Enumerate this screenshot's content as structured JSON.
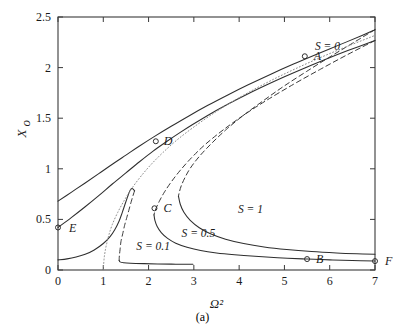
{
  "figure": {
    "caption": "(a)"
  },
  "chart_data": {
    "type": "line",
    "title": "",
    "subtitle": "",
    "xlabel": "Ω²",
    "ylabel": "X",
    "ylabel_sub": "o",
    "xlim": [
      0,
      7
    ],
    "ylim": [
      0,
      2.5
    ],
    "xticks": [
      0,
      1,
      2,
      3,
      4,
      5,
      6,
      7
    ],
    "xtick_labels": [
      "0",
      "1",
      "2",
      "3",
      "4",
      "5",
      "6",
      "7"
    ],
    "yticks": [
      0,
      0.5,
      1,
      1.5,
      2,
      2.5
    ],
    "ytick_labels": [
      "0",
      "0.5",
      "1",
      "1.5",
      "2",
      "2.5"
    ],
    "grid": false,
    "legend_position": "inline-annotations",
    "series": [
      {
        "name": "S = 0.1 lower-stable",
        "style": "solid",
        "points": [
          [
            0.0,
            0.1
          ],
          [
            0.2,
            0.11
          ],
          [
            0.4,
            0.128
          ],
          [
            0.6,
            0.155
          ],
          [
            0.8,
            0.198
          ],
          [
            1.0,
            0.262
          ],
          [
            1.15,
            0.33
          ],
          [
            1.25,
            0.395
          ],
          [
            1.35,
            0.485
          ],
          [
            1.42,
            0.57
          ],
          [
            1.48,
            0.65
          ],
          [
            1.53,
            0.715
          ],
          [
            1.57,
            0.765
          ],
          [
            1.6,
            0.793
          ],
          [
            1.63,
            0.805
          ],
          [
            1.66,
            0.8
          ],
          [
            1.69,
            0.782
          ]
        ]
      },
      {
        "name": "S = 0.1 unstable",
        "style": "dashed",
        "points": [
          [
            1.69,
            0.782
          ],
          [
            1.66,
            0.74
          ],
          [
            1.62,
            0.68
          ],
          [
            1.57,
            0.6
          ],
          [
            1.52,
            0.52
          ],
          [
            1.47,
            0.44
          ],
          [
            1.43,
            0.36
          ],
          [
            1.39,
            0.28
          ],
          [
            1.37,
            0.2
          ],
          [
            1.355,
            0.14
          ],
          [
            1.35,
            0.095
          ]
        ]
      },
      {
        "name": "S = 0.1 upper-stable",
        "style": "solid",
        "points": [
          [
            1.35,
            0.095
          ],
          [
            1.37,
            0.08
          ],
          [
            1.45,
            0.072
          ],
          [
            1.6,
            0.067
          ],
          [
            1.9,
            0.063
          ],
          [
            2.2,
            0.06
          ],
          [
            2.5,
            0.058
          ],
          [
            2.8,
            0.057
          ],
          [
            2.98,
            0.056
          ]
        ]
      },
      {
        "name": "S = 0.5 lower-stable",
        "style": "solid",
        "points": [
          [
            0.0,
            0.42
          ],
          [
            0.3,
            0.52
          ],
          [
            0.6,
            0.625
          ],
          [
            0.9,
            0.735
          ],
          [
            1.2,
            0.85
          ],
          [
            1.5,
            0.96
          ],
          [
            1.8,
            1.07
          ],
          [
            2.1,
            1.175
          ],
          [
            2.4,
            1.27
          ],
          [
            2.7,
            1.36
          ],
          [
            3.0,
            1.445
          ],
          [
            3.4,
            1.552
          ],
          [
            3.8,
            1.65
          ],
          [
            4.2,
            1.742
          ],
          [
            4.6,
            1.828
          ],
          [
            5.0,
            1.91
          ],
          [
            5.45,
            1.997
          ],
          [
            5.9,
            2.08
          ],
          [
            6.4,
            2.168
          ],
          [
            7.0,
            2.268
          ]
        ]
      },
      {
        "name": "S = 0.5 unstable",
        "style": "dashed",
        "points": [
          [
            7.0,
            2.268
          ],
          [
            6.4,
            2.13
          ],
          [
            5.8,
            1.985
          ],
          [
            5.2,
            1.835
          ],
          [
            4.6,
            1.675
          ],
          [
            4.1,
            1.53
          ],
          [
            3.65,
            1.385
          ],
          [
            3.25,
            1.24
          ],
          [
            2.95,
            1.11
          ],
          [
            2.7,
            0.985
          ],
          [
            2.5,
            0.87
          ],
          [
            2.35,
            0.77
          ],
          [
            2.25,
            0.69
          ],
          [
            2.18,
            0.625
          ],
          [
            2.14,
            0.58
          ],
          [
            2.12,
            0.545
          ]
        ]
      },
      {
        "name": "S = 0.5 upper-stable",
        "style": "solid",
        "points": [
          [
            2.12,
            0.545
          ],
          [
            2.14,
            0.49
          ],
          [
            2.19,
            0.43
          ],
          [
            2.28,
            0.37
          ],
          [
            2.42,
            0.312
          ],
          [
            2.6,
            0.265
          ],
          [
            2.85,
            0.225
          ],
          [
            3.15,
            0.192
          ],
          [
            3.5,
            0.168
          ],
          [
            3.9,
            0.15
          ],
          [
            4.35,
            0.135
          ],
          [
            4.85,
            0.122
          ],
          [
            5.4,
            0.11
          ],
          [
            5.5,
            0.108
          ],
          [
            6.0,
            0.1
          ],
          [
            6.5,
            0.093
          ],
          [
            7.0,
            0.088
          ]
        ]
      },
      {
        "name": "S = 1 lower-stable",
        "style": "solid",
        "points": [
          [
            0.0,
            0.68
          ],
          [
            0.3,
            0.77
          ],
          [
            0.6,
            0.86
          ],
          [
            0.9,
            0.952
          ],
          [
            1.2,
            1.045
          ],
          [
            1.5,
            1.135
          ],
          [
            1.8,
            1.225
          ],
          [
            2.15,
            1.325
          ],
          [
            2.5,
            1.42
          ],
          [
            2.9,
            1.525
          ],
          [
            3.3,
            1.625
          ],
          [
            3.75,
            1.73
          ],
          [
            4.2,
            1.83
          ],
          [
            4.7,
            1.935
          ],
          [
            5.2,
            2.035
          ],
          [
            5.7,
            2.13
          ],
          [
            6.2,
            2.222
          ],
          [
            6.7,
            2.315
          ],
          [
            7.0,
            2.375
          ]
        ]
      },
      {
        "name": "S = 1 unstable",
        "style": "dashed",
        "points": [
          [
            7.0,
            2.375
          ],
          [
            6.5,
            2.24
          ],
          [
            6.0,
            2.105
          ],
          [
            5.5,
            1.965
          ],
          [
            5.0,
            1.82
          ],
          [
            4.55,
            1.678
          ],
          [
            4.1,
            1.53
          ],
          [
            3.72,
            1.39
          ],
          [
            3.4,
            1.255
          ],
          [
            3.12,
            1.122
          ],
          [
            2.92,
            1.005
          ],
          [
            2.8,
            0.91
          ],
          [
            2.72,
            0.83
          ],
          [
            2.68,
            0.77
          ],
          [
            2.66,
            0.73
          ]
        ]
      },
      {
        "name": "S = 1 upper-stable",
        "style": "solid",
        "points": [
          [
            2.66,
            0.73
          ],
          [
            2.7,
            0.65
          ],
          [
            2.78,
            0.57
          ],
          [
            2.92,
            0.49
          ],
          [
            3.12,
            0.418
          ],
          [
            3.38,
            0.356
          ],
          [
            3.7,
            0.305
          ],
          [
            4.1,
            0.262
          ],
          [
            4.55,
            0.228
          ],
          [
            5.05,
            0.202
          ],
          [
            5.6,
            0.182
          ],
          [
            6.15,
            0.168
          ],
          [
            6.6,
            0.16
          ],
          [
            7.0,
            0.155
          ]
        ]
      },
      {
        "name": "S = 0 backbone",
        "style": "dotted",
        "points": [
          [
            1.0,
            0.0
          ],
          [
            1.02,
            0.12
          ],
          [
            1.06,
            0.23
          ],
          [
            1.12,
            0.34
          ],
          [
            1.2,
            0.45
          ],
          [
            1.32,
            0.57
          ],
          [
            1.46,
            0.685
          ],
          [
            1.62,
            0.8
          ],
          [
            1.82,
            0.92
          ],
          [
            2.05,
            1.04
          ],
          [
            2.32,
            1.162
          ],
          [
            2.62,
            1.282
          ],
          [
            2.96,
            1.4
          ],
          [
            3.34,
            1.52
          ],
          [
            3.76,
            1.64
          ],
          [
            4.22,
            1.758
          ],
          [
            4.72,
            1.876
          ],
          [
            5.26,
            1.992
          ],
          [
            5.84,
            2.108
          ],
          [
            6.4,
            2.212
          ],
          [
            7.0,
            2.318
          ]
        ]
      }
    ],
    "annotations": [
      {
        "label": "S = 0.1",
        "x": 2.1,
        "y": 0.195
      },
      {
        "label": "S = 0.5",
        "x": 3.1,
        "y": 0.33
      },
      {
        "label": "S = 1",
        "x": 4.25,
        "y": 0.56
      },
      {
        "label": "S = 0",
        "x": 5.95,
        "y": 2.175
      }
    ],
    "markers": [
      {
        "label": "A",
        "x": 5.45,
        "y": 2.112,
        "label_dx": 9,
        "label_dy": 4
      },
      {
        "label": "B",
        "x": 5.5,
        "y": 0.108,
        "label_dx": 9,
        "label_dy": 4
      },
      {
        "label": "C",
        "x": 2.13,
        "y": 0.61,
        "label_dx": 9,
        "label_dy": 4
      },
      {
        "label": "D",
        "x": 2.16,
        "y": 1.272,
        "label_dx": 8,
        "label_dy": 4
      },
      {
        "label": "E",
        "x": 0.0,
        "y": 0.42,
        "label_dx": 11,
        "label_dy": 5
      },
      {
        "label": "F",
        "x": 7.0,
        "y": 0.088,
        "label_dx": 10,
        "label_dy": 4
      }
    ]
  }
}
